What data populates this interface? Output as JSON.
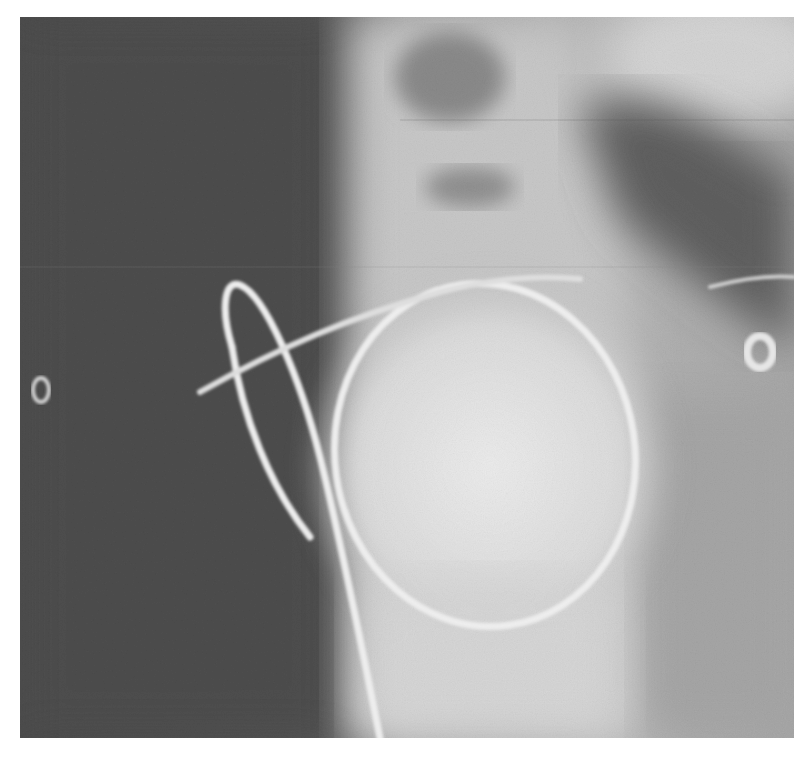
{
  "image": {
    "kind": "radiograph",
    "description": "Grayscale chest X-ray showing a looped wire/catheter forming a large circle over the cardiac silhouette, with two ring markers on the left and right edges",
    "colors": {
      "background": "#ffffff",
      "dark_field": "#4a4a4a",
      "mid_field": "#8c8c8c",
      "bright_field": "#e4e4e4",
      "wire": "#ececec",
      "marker": "#d8d8d8"
    },
    "markers": [
      {
        "name": "left-ring-marker",
        "label": "O"
      },
      {
        "name": "right-ring-marker",
        "label": "O"
      }
    ]
  }
}
